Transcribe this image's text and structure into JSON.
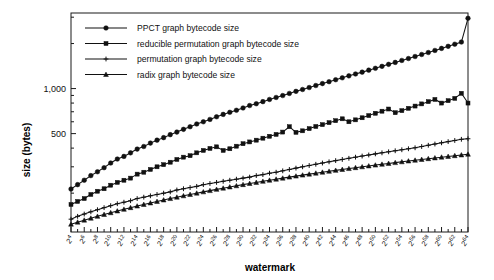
{
  "chart_data": {
    "type": "line",
    "title": "",
    "xlabel": "watermark",
    "ylabel": "size (bytes)",
    "yscale": "log",
    "ylim": [
      110,
      3200
    ],
    "ytick_values": [
      200,
      300,
      400,
      500,
      600,
      700,
      800,
      900,
      1000,
      2000,
      3000
    ],
    "ytick_labels": [
      "",
      "",
      "",
      "500",
      "",
      "",
      "",
      "",
      "1,000",
      "",
      ""
    ],
    "grid": false,
    "legend_position": "top-left",
    "x_exponents": [
      4,
      5,
      6,
      7,
      8,
      9,
      10,
      11,
      12,
      13,
      14,
      15,
      16,
      17,
      18,
      19,
      20,
      21,
      22,
      23,
      24,
      25,
      26,
      27,
      28,
      29,
      30,
      31,
      32,
      33,
      34,
      35,
      36,
      37,
      38,
      39,
      40,
      41,
      42,
      43,
      44,
      45,
      46,
      47,
      48,
      49,
      50,
      51,
      52,
      53,
      54,
      55,
      56,
      57,
      58,
      59,
      60,
      61,
      62,
      63,
      64
    ],
    "xtick_labels": [
      "2^4",
      "",
      "2^6",
      "",
      "2^8",
      "",
      "2^10",
      "",
      "2^12",
      "",
      "2^14",
      "",
      "2^16",
      "",
      "2^18",
      "",
      "2^20",
      "",
      "2^22",
      "",
      "2^24",
      "",
      "2^26",
      "",
      "2^28",
      "",
      "2^30",
      "",
      "2^32",
      "",
      "2^34",
      "",
      "2^36",
      "",
      "2^38",
      "",
      "2^40",
      "",
      "2^42",
      "",
      "2^44",
      "",
      "2^46",
      "",
      "2^48",
      "",
      "2^50",
      "",
      "2^52",
      "",
      "2^54",
      "",
      "2^56",
      "",
      "2^58",
      "",
      "2^60",
      "",
      "2^62",
      "",
      "2^64"
    ],
    "series": [
      {
        "name": "PPCT graph bytecode size",
        "marker": "circle",
        "values": [
          213,
          228,
          244,
          262,
          278,
          296,
          318,
          338,
          352,
          372,
          394,
          410,
          432,
          452,
          470,
          492,
          512,
          534,
          556,
          580,
          600,
          622,
          648,
          672,
          694,
          716,
          742,
          770,
          792,
          818,
          846,
          872,
          898,
          928,
          958,
          986,
          1016,
          1048,
          1080,
          1112,
          1146,
          1180,
          1216,
          1252,
          1288,
          1328,
          1366,
          1408,
          1452,
          1496,
          1542,
          1588,
          1638,
          1690,
          1742,
          1798,
          1856,
          1916,
          1980,
          2046,
          2950
        ]
      },
      {
        "name": "reducible permutation graph bytecode size",
        "marker": "square",
        "values": [
          168,
          176,
          184,
          196,
          206,
          214,
          226,
          236,
          244,
          252,
          268,
          276,
          288,
          300,
          310,
          322,
          336,
          348,
          356,
          372,
          386,
          398,
          408,
          386,
          396,
          412,
          428,
          440,
          452,
          466,
          480,
          494,
          512,
          556,
          510,
          522,
          540,
          558,
          574,
          592,
          610,
          628,
          600,
          618,
          638,
          660,
          684,
          706,
          730,
          690,
          712,
          738,
          764,
          790,
          818,
          846,
          800,
          830,
          860,
          930,
          800
        ]
      },
      {
        "name": "permutation graph bytecode size",
        "marker": "plus",
        "values": [
          134,
          140,
          145,
          150,
          155,
          160,
          165,
          170,
          174,
          178,
          184,
          188,
          192,
          196,
          200,
          204,
          210,
          214,
          218,
          222,
          228,
          232,
          236,
          240,
          244,
          248,
          252,
          256,
          262,
          266,
          272,
          276,
          282,
          288,
          294,
          300,
          306,
          312,
          318,
          324,
          330,
          336,
          342,
          348,
          354,
          360,
          366,
          372,
          378,
          384,
          390,
          396,
          402,
          410,
          418,
          426,
          434,
          442,
          450,
          458,
          462
        ]
      },
      {
        "name": "radix graph bytecode size",
        "marker": "triangle",
        "values": [
          124,
          128,
          132,
          136,
          140,
          144,
          148,
          152,
          156,
          160,
          164,
          168,
          172,
          176,
          180,
          184,
          188,
          192,
          196,
          200,
          204,
          208,
          212,
          216,
          220,
          224,
          228,
          232,
          236,
          240,
          244,
          248,
          252,
          256,
          260,
          264,
          268,
          272,
          276,
          280,
          284,
          288,
          292,
          296,
          300,
          304,
          308,
          312,
          316,
          320,
          324,
          328,
          332,
          336,
          340,
          344,
          348,
          352,
          356,
          360,
          364
        ]
      }
    ]
  },
  "legend": {
    "items": [
      {
        "label": "PPCT graph bytecode size",
        "marker": "circle"
      },
      {
        "label": "reducible permutation graph bytecode size",
        "marker": "square"
      },
      {
        "label": "permutation graph bytecode size",
        "marker": "plus"
      },
      {
        "label": "radix graph bytecode size",
        "marker": "triangle"
      }
    ]
  }
}
